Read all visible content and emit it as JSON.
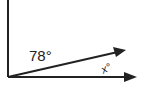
{
  "diagram": {
    "type": "angle-diagram",
    "colors": {
      "line": "#222222",
      "background": "#ffffff"
    },
    "rays": [
      {
        "id": "vertical",
        "from": [
          8,
          77
        ],
        "to": [
          8,
          0
        ],
        "arrow": false
      },
      {
        "id": "slanted",
        "from": [
          8,
          77
        ],
        "to": [
          126,
          50
        ],
        "arrow": true
      },
      {
        "id": "horizontal",
        "from": [
          8,
          77
        ],
        "to": [
          137,
          77
        ],
        "arrow": true
      }
    ],
    "labels": {
      "angle_between_vertical_and_slanted": "78°",
      "angle_between_slanted_and_horizontal": "x°"
    }
  }
}
